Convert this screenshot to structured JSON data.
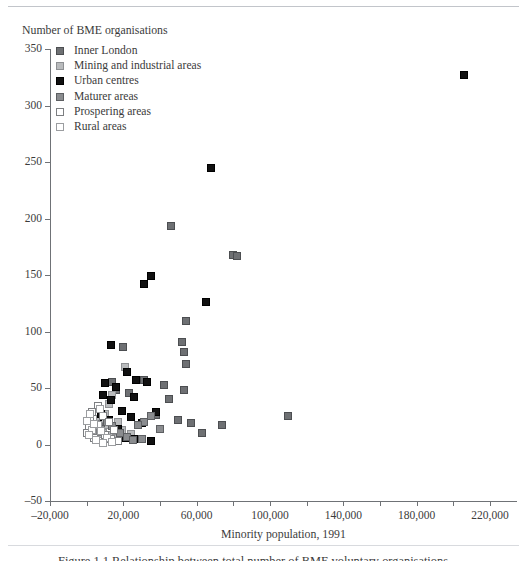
{
  "figure": {
    "caption": "Figure 1.1  Relationship between total number of BME voluntary organisations"
  },
  "chart_data": {
    "type": "scatter",
    "title": "",
    "ylabel": "Number of BME organisations",
    "xlabel": "Minority population, 1991",
    "xlim": [
      -20000,
      240000
    ],
    "ylim": [
      -50,
      350
    ],
    "grid": false,
    "legend_position": "top-left-inside",
    "x_ticks": [
      -20000,
      0,
      20000,
      40000,
      60000,
      80000,
      100000,
      120000,
      140000,
      160000,
      180000,
      200000,
      220000
    ],
    "x_tick_labels": [
      {
        "value": -20000,
        "label": "–20,000"
      },
      {
        "value": 20000,
        "label": "20,000"
      },
      {
        "value": 60000,
        "label": "60,000"
      },
      {
        "value": 100000,
        "label": "100,000"
      },
      {
        "value": 140000,
        "label": "140,000"
      },
      {
        "value": 180000,
        "label": "180,000"
      },
      {
        "value": 220000,
        "label": "220,000"
      }
    ],
    "y_ticks": [
      -50,
      0,
      50,
      100,
      150,
      200,
      250,
      300,
      350
    ],
    "y_tick_labels": [
      {
        "value": -50,
        "label": "–50"
      },
      {
        "value": 0,
        "label": "0"
      },
      {
        "value": 50,
        "label": "50"
      },
      {
        "value": 100,
        "label": "100"
      },
      {
        "value": 150,
        "label": "150"
      },
      {
        "value": 200,
        "label": "200"
      },
      {
        "value": 250,
        "label": "250"
      },
      {
        "value": 300,
        "label": "300"
      },
      {
        "value": 350,
        "label": "350"
      }
    ],
    "legend": [
      {
        "label": "Inner London",
        "key": "inner-london",
        "color": "#6e7073"
      },
      {
        "label": "Mining and industrial areas",
        "key": "mining",
        "color": "#b9bbbd"
      },
      {
        "label": "Urban centres",
        "key": "urban",
        "color": "#111111"
      },
      {
        "label": "Maturer areas",
        "key": "maturer",
        "color": "#8a8c8f"
      },
      {
        "label": "Prospering areas",
        "key": "prospering",
        "color": "#ffffff"
      },
      {
        "label": "Rural areas",
        "key": "rural",
        "color": "#ffffff"
      }
    ],
    "series": [
      {
        "name": "Inner London",
        "key": "inner-london",
        "points": [
          [
            46000,
            193
          ],
          [
            80000,
            168
          ],
          [
            82000,
            167
          ],
          [
            54000,
            109
          ],
          [
            52000,
            91
          ],
          [
            53000,
            82
          ],
          [
            20000,
            86
          ],
          [
            54000,
            71
          ],
          [
            53000,
            48
          ],
          [
            31000,
            57
          ],
          [
            23000,
            46
          ],
          [
            42000,
            53
          ],
          [
            45000,
            40
          ],
          [
            38000,
            26
          ],
          [
            50000,
            22
          ],
          [
            57000,
            19
          ],
          [
            63000,
            10
          ],
          [
            74000,
            17
          ],
          [
            110000,
            25
          ],
          [
            14000,
            55
          ],
          [
            16000,
            48
          ],
          [
            9000,
            24
          ],
          [
            7000,
            20
          ]
        ]
      },
      {
        "name": "Mining and industrial areas",
        "key": "mining",
        "points": [
          [
            21000,
            69
          ],
          [
            14000,
            44
          ],
          [
            12000,
            36
          ],
          [
            10000,
            27
          ],
          [
            7000,
            23
          ],
          [
            11000,
            17
          ],
          [
            17000,
            20
          ],
          [
            5000,
            17
          ],
          [
            19000,
            13
          ],
          [
            9000,
            10
          ],
          [
            13000,
            8
          ],
          [
            6000,
            9
          ],
          [
            24000,
            9
          ],
          [
            4000,
            13
          ],
          [
            16000,
            6
          ]
        ]
      },
      {
        "name": "Urban centres",
        "key": "urban",
        "points": [
          [
            206000,
            327
          ],
          [
            68000,
            245
          ],
          [
            35000,
            149
          ],
          [
            31000,
            142
          ],
          [
            65000,
            126
          ],
          [
            13000,
            88
          ],
          [
            22000,
            64
          ],
          [
            10000,
            54
          ],
          [
            27000,
            57
          ],
          [
            33000,
            55
          ],
          [
            16000,
            51
          ],
          [
            9000,
            44
          ],
          [
            26000,
            42
          ],
          [
            13000,
            39
          ],
          [
            19000,
            30
          ],
          [
            38000,
            29
          ],
          [
            8000,
            27
          ],
          [
            24000,
            24
          ],
          [
            12000,
            22
          ],
          [
            30000,
            19
          ],
          [
            6000,
            18
          ],
          [
            17000,
            14
          ],
          [
            21000,
            6
          ],
          [
            26000,
            5
          ],
          [
            35000,
            3
          ]
        ]
      },
      {
        "name": "Maturer areas",
        "key": "maturer",
        "points": [
          [
            35000,
            25
          ],
          [
            31000,
            20
          ],
          [
            28000,
            17
          ],
          [
            40000,
            14
          ],
          [
            11000,
            20
          ],
          [
            14000,
            16
          ],
          [
            8000,
            14
          ],
          [
            18000,
            10
          ],
          [
            22000,
            7
          ],
          [
            5000,
            11
          ],
          [
            3000,
            15
          ],
          [
            25000,
            4
          ],
          [
            30000,
            5
          ]
        ]
      },
      {
        "name": "Prospering areas",
        "key": "prospering",
        "points": [
          [
            6000,
            34
          ],
          [
            3000,
            29
          ],
          [
            9000,
            25
          ],
          [
            2000,
            22
          ],
          [
            12000,
            20
          ],
          [
            5000,
            18
          ],
          [
            1000,
            16
          ],
          [
            15000,
            13
          ],
          [
            7000,
            11
          ],
          [
            10000,
            8
          ],
          [
            4000,
            6
          ],
          [
            13000,
            5
          ],
          [
            0,
            10
          ],
          [
            17000,
            3
          ]
        ]
      },
      {
        "name": "Rural areas",
        "key": "rural",
        "points": [
          [
            2000,
            27
          ],
          [
            0,
            21
          ],
          [
            6000,
            17
          ],
          [
            3000,
            13
          ],
          [
            8000,
            12
          ],
          [
            1000,
            8
          ],
          [
            11000,
            6
          ],
          [
            5000,
            4
          ],
          [
            14000,
            2
          ],
          [
            9000,
            1
          ],
          [
            4000,
            18
          ],
          [
            7000,
            31
          ]
        ]
      }
    ]
  }
}
